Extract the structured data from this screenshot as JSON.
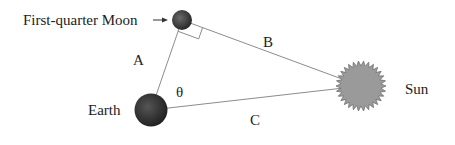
{
  "diagram": {
    "labels": {
      "moon": "First-quarter Moon",
      "earth": "Earth",
      "sun": "Sun",
      "side_a": "A",
      "side_b": "B",
      "side_c": "C",
      "angle": "θ"
    },
    "colors": {
      "line": "#8c8c8c",
      "sun_fill": "#9a9a9a",
      "body_dark": "#2a2a2a",
      "text": "#222222"
    }
  }
}
